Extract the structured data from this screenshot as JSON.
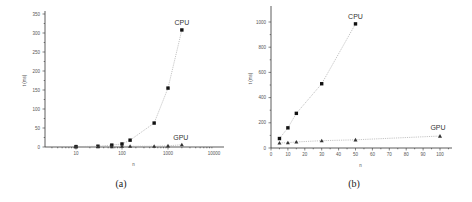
{
  "chart_data": [
    {
      "type": "line",
      "panel": "(a)",
      "xlabel": "n",
      "ylabel": "t (ms)",
      "xscale": "log",
      "xlim": [
        1,
        10000
      ],
      "ylim": [
        0,
        350
      ],
      "xticks": [
        10,
        100,
        1000,
        10000
      ],
      "xtick_labels": [
        "10",
        "100",
        "1000",
        "10000"
      ],
      "yticks": [
        0,
        50,
        100,
        150,
        200,
        250,
        300,
        350
      ],
      "ytick_labels": [
        "0",
        "50",
        "100",
        "150",
        "200",
        "250",
        "300",
        "350"
      ],
      "series": [
        {
          "name": "CPU",
          "marker": "square",
          "x": [
            10,
            30,
            60,
            100,
            150,
            500,
            1000,
            2000
          ],
          "values": [
            1,
            2,
            5,
            8,
            18,
            63,
            155,
            308
          ]
        },
        {
          "name": "GPU",
          "marker": "triangle",
          "x": [
            10,
            30,
            60,
            100,
            150,
            500,
            1000,
            2000
          ],
          "values": [
            1,
            1,
            1,
            2,
            2,
            2,
            3,
            6
          ]
        }
      ],
      "annotations": [
        "CPU",
        "GPU"
      ],
      "grid": false,
      "legend": "inline labels"
    },
    {
      "type": "line",
      "panel": "(b)",
      "xlabel": "n",
      "ylabel": "t (ms)",
      "xscale": "linear",
      "xlim": [
        0,
        100
      ],
      "ylim": [
        0,
        1100
      ],
      "xticks": [
        0,
        10,
        20,
        30,
        40,
        50,
        60,
        70,
        80,
        90,
        100
      ],
      "xtick_labels": [
        "0",
        "10",
        "20",
        "30",
        "40",
        "50",
        "60",
        "70",
        "80",
        "90",
        "100"
      ],
      "yticks": [
        0,
        200,
        400,
        600,
        800,
        1000
      ],
      "ytick_labels": [
        "0",
        "200",
        "400",
        "600",
        "800",
        "1000"
      ],
      "series": [
        {
          "name": "CPU",
          "marker": "square",
          "x": [
            5,
            10,
            15,
            30,
            50
          ],
          "values": [
            75,
            160,
            275,
            510,
            985
          ]
        },
        {
          "name": "GPU",
          "marker": "triangle",
          "x": [
            5,
            10,
            15,
            30,
            50,
            100
          ],
          "values": [
            40,
            42,
            48,
            58,
            65,
            95
          ]
        }
      ],
      "annotations": [
        "CPU",
        "GPU"
      ],
      "grid": false,
      "legend": "inline labels"
    }
  ],
  "captions": {
    "a": "(a)",
    "b": "(b)"
  },
  "labels": {
    "cpu": "CPU",
    "gpu": "GPU",
    "x": "n",
    "y": "t (ms)"
  }
}
